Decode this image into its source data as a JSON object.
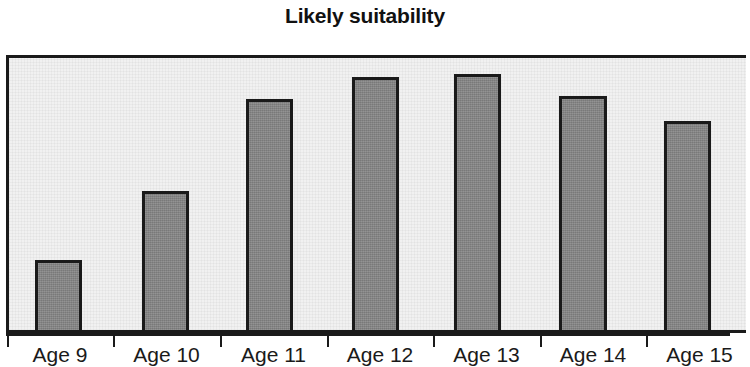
{
  "chart_data": {
    "type": "bar",
    "title": "Likely suitability",
    "xlabel": "",
    "ylabel": "",
    "categories": [
      "Age 9",
      "Age 10",
      "Age 11",
      "Age 12",
      "Age 13",
      "Age 14",
      "Age 15"
    ],
    "values": [
      25,
      50,
      83,
      91,
      92,
      84,
      75
    ],
    "ylim": [
      0,
      100
    ],
    "grid": false,
    "legend": null,
    "colors": {
      "bar_fill": "#848484",
      "bar_outline": "#1a1a1a",
      "plot_background": "#f1f1f1",
      "figure_background": "#ffffff",
      "text": "#1a1a1a"
    }
  },
  "chart": {
    "title": "Likely suitability",
    "bars": [
      {
        "label": "Age 9",
        "value": 25,
        "left": 32,
        "width": 47,
        "height_pct": 25
      },
      {
        "label": "Age 10",
        "value": 50,
        "left": 139,
        "width": 47,
        "height_pct": 50
      },
      {
        "label": "Age 11",
        "value": 83,
        "left": 243,
        "width": 47,
        "height_pct": 83
      },
      {
        "label": "Age 12",
        "value": 91,
        "left": 349,
        "width": 47,
        "height_pct": 91
      },
      {
        "label": "Age 13",
        "value": 92,
        "left": 451,
        "width": 47,
        "height_pct": 92
      },
      {
        "label": "Age 14",
        "value": 84,
        "left": 556,
        "width": 48,
        "height_pct": 84
      },
      {
        "label": "Age 15",
        "value": 75,
        "left": 661,
        "width": 47,
        "height_pct": 75
      }
    ],
    "ticks": [
      {
        "label": "Age 9",
        "x": 7
      },
      {
        "label": "Age 10",
        "x": 113
      },
      {
        "label": "Age 11",
        "x": 220
      },
      {
        "label": "Age 12",
        "x": 327
      },
      {
        "label": "Age 13",
        "x": 433
      },
      {
        "label": "Age 14",
        "x": 540
      },
      {
        "label": "Age 15",
        "x": 646
      }
    ]
  }
}
